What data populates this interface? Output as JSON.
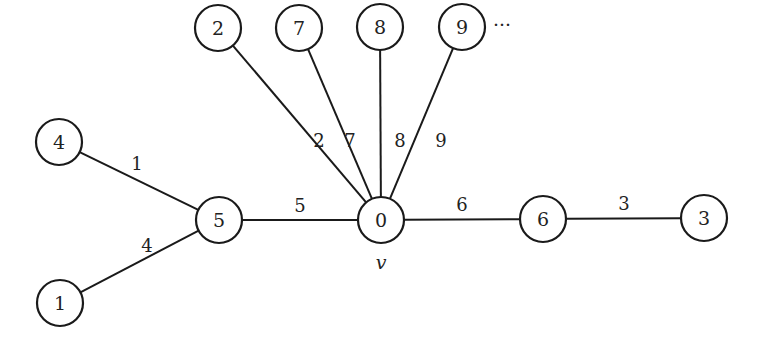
{
  "diagram": {
    "type": "weighted-tree",
    "node_radius": 23,
    "nodes": [
      {
        "id": "2",
        "label": "2",
        "x": 218,
        "y": 28
      },
      {
        "id": "7",
        "label": "7",
        "x": 299,
        "y": 28
      },
      {
        "id": "8",
        "label": "8",
        "x": 380,
        "y": 27
      },
      {
        "id": "9",
        "label": "9",
        "x": 462,
        "y": 27
      },
      {
        "id": "4",
        "label": "4",
        "x": 59,
        "y": 142
      },
      {
        "id": "5",
        "label": "5",
        "x": 219,
        "y": 220
      },
      {
        "id": "0",
        "label": "0",
        "x": 381,
        "y": 220
      },
      {
        "id": "6",
        "label": "6",
        "x": 543,
        "y": 219
      },
      {
        "id": "3",
        "label": "3",
        "x": 704,
        "y": 218
      },
      {
        "id": "1",
        "label": "1",
        "x": 60,
        "y": 303
      }
    ],
    "edges": [
      {
        "from": "4",
        "to": "5",
        "weight": "1",
        "label_x": 137,
        "label_y": 163
      },
      {
        "from": "1",
        "to": "5",
        "weight": "4",
        "label_x": 147,
        "label_y": 245
      },
      {
        "from": "5",
        "to": "0",
        "weight": "5",
        "label_x": 300,
        "label_y": 205
      },
      {
        "from": "2",
        "to": "0",
        "weight": "2",
        "label_x": 319,
        "label_y": 140
      },
      {
        "from": "7",
        "to": "0",
        "weight": "7",
        "label_x": 350,
        "label_y": 140
      },
      {
        "from": "8",
        "to": "0",
        "weight": "8",
        "label_x": 400,
        "label_y": 140
      },
      {
        "from": "9",
        "to": "0",
        "weight": "9",
        "label_x": 441,
        "label_y": 140
      },
      {
        "from": "0",
        "to": "6",
        "weight": "6",
        "label_x": 462,
        "label_y": 204
      },
      {
        "from": "6",
        "to": "3",
        "weight": "3",
        "label_x": 624,
        "label_y": 203
      }
    ],
    "annotations": [
      {
        "id": "ellipsis",
        "text": "···",
        "x": 502,
        "y": 24,
        "italic": false
      },
      {
        "id": "root-label",
        "text": "v",
        "x": 381,
        "y": 262,
        "italic": true
      }
    ]
  }
}
